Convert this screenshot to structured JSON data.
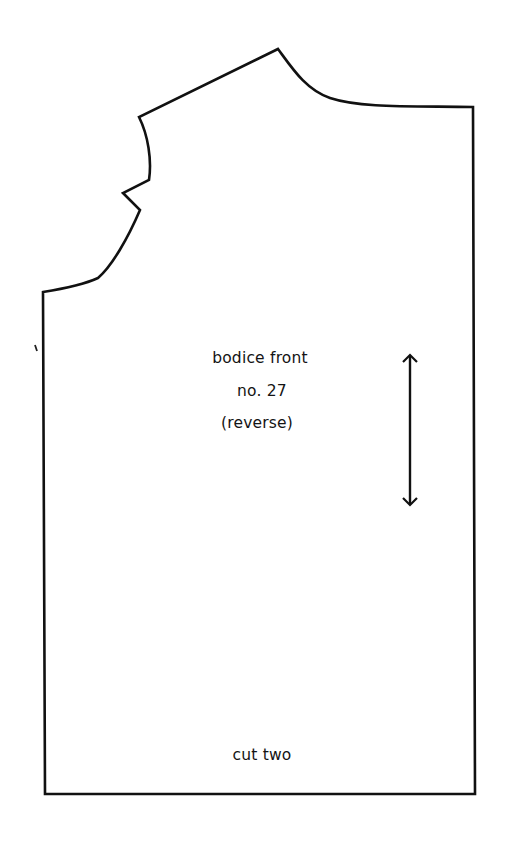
{
  "pattern": {
    "piece_name": "bodice front",
    "number": "no. 27",
    "note": "(reverse)",
    "cut_instruction": "cut two",
    "grainline": "double-arrow-icon",
    "stroke_color": "#111111",
    "background_color": "#ffffff"
  }
}
